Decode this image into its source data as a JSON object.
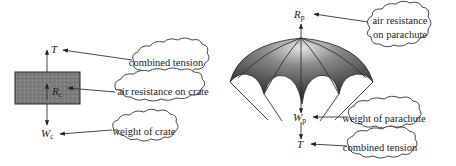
{
  "crate": {
    "symbols": {
      "tension": "T",
      "resistance": "R",
      "resistance_sub": "c",
      "weight": "W",
      "weight_sub": "c"
    },
    "labels": {
      "tension": "combined tension",
      "resistance": "air resistance on crate",
      "weight": "weight of crate"
    }
  },
  "parachute": {
    "symbols": {
      "resistance": "R",
      "resistance_sub": "p",
      "weight": "W",
      "weight_sub": "p",
      "tension": "T"
    },
    "labels": {
      "resistance_line1": "air resistance",
      "resistance_line2": "on parachute",
      "weight": "weight of parachute",
      "tension": "combined tension"
    }
  },
  "colors": {
    "crate_fill": "#7a7a7a",
    "canopy_dark": "#3a3a3a",
    "canopy_light": "#d8d8d8"
  }
}
